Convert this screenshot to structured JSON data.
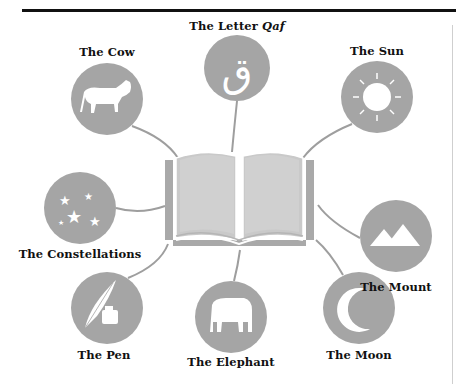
{
  "diagram": {
    "center": {
      "name": "open-book",
      "icon": "book-icon"
    },
    "colors": {
      "circle": "#a5a5a5",
      "book": "#c8c8c8",
      "book_dark": "#a9a9a9",
      "connector": "#9e9e9e",
      "glyph": "#ffffff",
      "text": "#111111"
    },
    "nodes": [
      {
        "id": "cow",
        "label": "The Cow",
        "icon": "cow-icon"
      },
      {
        "id": "qaf",
        "label_prefix": "The Letter ",
        "label_italic": "Qaf",
        "glyph": "ق",
        "icon": "arabic-letter-qaf-icon"
      },
      {
        "id": "sun",
        "label": "The Sun",
        "icon": "sun-icon"
      },
      {
        "id": "constellations",
        "label": "The Constellations",
        "icon": "stars-icon"
      },
      {
        "id": "mount",
        "label": "The Mount",
        "icon": "mountain-icon"
      },
      {
        "id": "pen",
        "label": "The Pen",
        "icon": "quill-pen-icon"
      },
      {
        "id": "elephant",
        "label": "The Elephant",
        "icon": "elephant-icon"
      },
      {
        "id": "moon",
        "label": "The Moon",
        "icon": "crescent-moon-icon"
      }
    ]
  }
}
